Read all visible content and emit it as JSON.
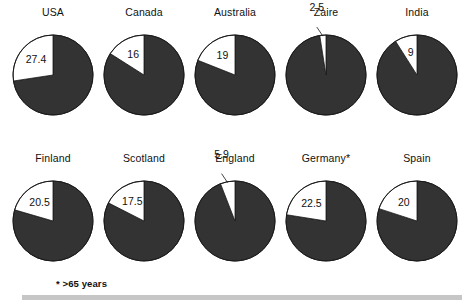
{
  "chart_data": {
    "type": "pie",
    "title": "",
    "subtitle": "",
    "xlabel": "",
    "ylabel": "",
    "legend": [],
    "grid": false,
    "slice_colors": {
      "highlight": "#ffffff",
      "remainder": "#333333",
      "outline": "#1a1a1a"
    },
    "start_angle_deg": 90,
    "direction": "counterclockwise",
    "units": "percent",
    "categories": [
      "USA",
      "Canada",
      "Australia",
      "Zaire",
      "India",
      "Finland",
      "Scotland",
      "England",
      "Germany*",
      "Spain"
    ],
    "values": [
      27.4,
      16,
      19,
      2.5,
      9,
      20.5,
      17.5,
      5.9,
      22.5,
      20
    ],
    "annotations": [
      "* >65 years"
    ]
  },
  "figure": {
    "footnote": "* >65 years",
    "rows": [
      {
        "row_index": 0,
        "pies": [
          {
            "name": "usa",
            "title": "USA",
            "value_label": "27.4",
            "value": 27.4,
            "label_placement": "inside"
          },
          {
            "name": "canada",
            "title": "Canada",
            "value_label": "16",
            "value": 16,
            "label_placement": "inside"
          },
          {
            "name": "australia",
            "title": "Australia",
            "value_label": "19",
            "value": 19,
            "label_placement": "inside"
          },
          {
            "name": "zaire",
            "title": "Zaire",
            "value_label": "2.5",
            "value": 2.5,
            "label_placement": "outside"
          },
          {
            "name": "india",
            "title": "India",
            "value_label": "9",
            "value": 9,
            "label_placement": "inside"
          }
        ]
      },
      {
        "row_index": 1,
        "pies": [
          {
            "name": "finland",
            "title": "Finland",
            "value_label": "20.5",
            "value": 20.5,
            "label_placement": "inside"
          },
          {
            "name": "scotland",
            "title": "Scotland",
            "value_label": "17.5",
            "value": 17.5,
            "label_placement": "inside"
          },
          {
            "name": "england",
            "title": "England",
            "value_label": "5.9",
            "value": 5.9,
            "label_placement": "outside"
          },
          {
            "name": "germany",
            "title": "Germany*",
            "value_label": "22.5",
            "value": 22.5,
            "label_placement": "inside"
          },
          {
            "name": "spain",
            "title": "Spain",
            "value_label": "20",
            "value": 20,
            "label_placement": "inside"
          }
        ]
      }
    ]
  }
}
